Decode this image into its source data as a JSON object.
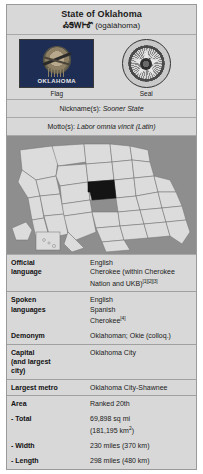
{
  "infobox": {
    "title": {
      "main": "State of Oklahoma",
      "native_syllabary": "ᎣᎦᎳᎰᎹ",
      "native_romanized": "(ògàlàhoma)"
    },
    "emblems": [
      {
        "name": "flag",
        "caption": "Flag",
        "text_on_flag": "OKLAHOMA"
      },
      {
        "name": "seal",
        "caption": "Seal"
      }
    ],
    "nickname": {
      "label": "Nickname(s):",
      "value": "Sooner State"
    },
    "motto": {
      "label": "Motto(s):",
      "value": "Labor omnia vincit (Latin)"
    },
    "map": {
      "alt": "Map of the United States with Oklahoma highlighted",
      "highlight_state": "Oklahoma",
      "highlight_color": "#141414",
      "state_fill": "#dcdcdc",
      "ocean_color": "#8e8e8e"
    },
    "rows": [
      {
        "key": "Official language",
        "key_lines": [
          "Official",
          "language"
        ],
        "values": [
          "English",
          "Cherokee (within Cherokee Nation and UKB)"
        ],
        "citations": "[1][2][3]"
      },
      {
        "key": "Spoken languages",
        "key_lines": [
          "Spoken",
          "languages"
        ],
        "values": [
          "English",
          "Spanish",
          "Cherokee"
        ],
        "citations": "[4]"
      },
      {
        "key": "Demonym",
        "key_lines": [
          "Demonym"
        ],
        "values": [
          "Oklahoman; Okie (colloq.)"
        ],
        "citations": ""
      },
      {
        "key": "Capital (and largest city)",
        "key_lines": [
          "Capital",
          "(and largest",
          "city)"
        ],
        "values": [
          "Oklahoma City"
        ],
        "citations": ""
      },
      {
        "key": "Largest metro",
        "key_lines": [
          "Largest metro"
        ],
        "values": [
          "Oklahoma City-Shawnee"
        ],
        "citations": ""
      },
      {
        "key": "Area",
        "key_lines": [
          "Area"
        ],
        "values": [
          "Ranked 20th"
        ],
        "citations": ""
      },
      {
        "key": "- Total",
        "key_lines": [
          "- Total"
        ],
        "values": [
          "69,898 sq mi",
          "(181,195 km2)"
        ],
        "citations": ""
      },
      {
        "key": "- Width",
        "key_lines": [
          "- Width"
        ],
        "values": [
          "230 miles (370 km)"
        ],
        "citations": ""
      },
      {
        "key": "- Length",
        "key_lines": [
          "- Length"
        ],
        "values": [
          "298 miles (480 km)"
        ],
        "citations": ""
      }
    ]
  }
}
